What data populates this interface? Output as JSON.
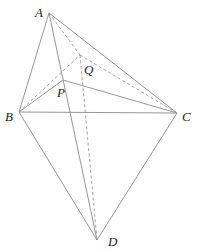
{
  "diagram": {
    "type": "geometry-figure",
    "points": {
      "A": {
        "x": 49,
        "y": 13,
        "label": "A",
        "label_x": 35,
        "label_y": 17
      },
      "B": {
        "x": 19,
        "y": 112,
        "label": "B",
        "label_x": 6,
        "label_y": 120
      },
      "C": {
        "x": 177,
        "y": 113,
        "label": "C",
        "label_x": 182,
        "label_y": 121
      },
      "D": {
        "x": 97,
        "y": 240,
        "label": "D",
        "label_x": 108,
        "label_y": 246
      },
      "P": {
        "x": 63,
        "y": 80,
        "label": "P",
        "label_x": 58,
        "label_y": 97
      },
      "Q": {
        "x": 80,
        "y": 55,
        "label": "Q",
        "label_x": 84,
        "label_y": 74
      }
    },
    "solid_edges": [
      [
        "A",
        "B"
      ],
      [
        "A",
        "C"
      ],
      [
        "B",
        "C"
      ],
      [
        "A",
        "D"
      ],
      [
        "B",
        "P"
      ],
      [
        "P",
        "C"
      ],
      [
        "B",
        "D"
      ],
      [
        "C",
        "D"
      ]
    ],
    "dashed_edges": [
      [
        "A",
        "Q"
      ],
      [
        "B",
        "Q"
      ],
      [
        "Q",
        "C"
      ],
      [
        "Q",
        "D"
      ]
    ],
    "colors": {
      "line": "#8a8a8a",
      "dashed": "#9a9a9a",
      "label": "#222222",
      "background": "#ffffff"
    }
  },
  "labels": {
    "A": "A",
    "B": "B",
    "C": "C",
    "D": "D",
    "P": "P",
    "Q": "Q"
  }
}
